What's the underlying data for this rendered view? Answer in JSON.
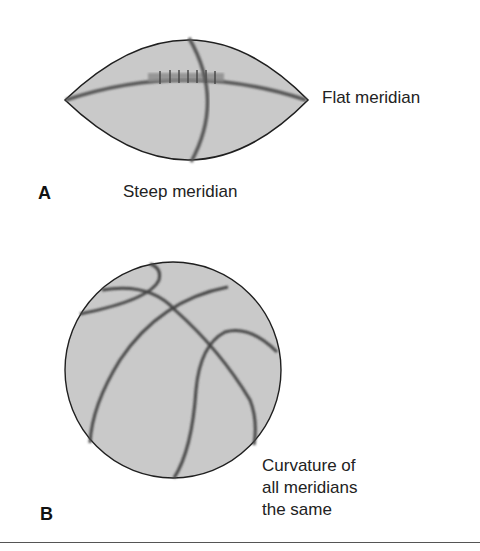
{
  "panels": [
    {
      "letter": "A",
      "object": "football",
      "labels": {
        "right": "Flat meridian",
        "bottom": "Steep meridian"
      }
    },
    {
      "letter": "B",
      "object": "basketball",
      "labels": {
        "caption_lines": [
          "Curvature of",
          "all meridians",
          "the same"
        ]
      }
    }
  ],
  "colors": {
    "ball_fill": "#c9c9c9",
    "outline": "#1f1f1f",
    "seam": "#555555"
  }
}
